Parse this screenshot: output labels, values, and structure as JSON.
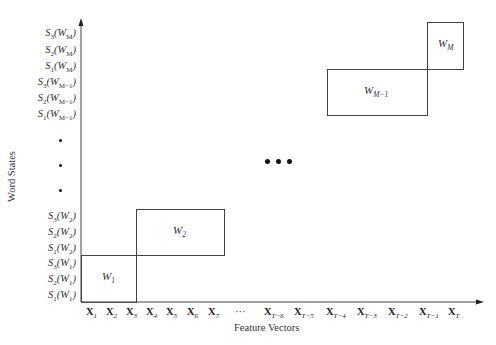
{
  "diagram": {
    "y_axis_title": "Word States",
    "x_axis_title": "Feature Vectors",
    "y_labels_top": [
      {
        "s": "S",
        "si": "3",
        "w": "W",
        "wi": "M",
        "text": "S3(WM)"
      },
      {
        "s": "S",
        "si": "2",
        "w": "W",
        "wi": "M",
        "text": "S2(WM)"
      },
      {
        "s": "S",
        "si": "1",
        "w": "W",
        "wi": "M",
        "text": "S1(WM)"
      },
      {
        "s": "S",
        "si": "3",
        "w": "W",
        "wi": "M−1",
        "text": "S3(WM−1)"
      },
      {
        "s": "S",
        "si": "2",
        "w": "W",
        "wi": "M−1",
        "text": "S2(WM−1)"
      },
      {
        "s": "S",
        "si": "1",
        "w": "W",
        "wi": "M−1",
        "text": "S1(WM−1)"
      }
    ],
    "y_labels_bottom": [
      {
        "s": "S",
        "si": "3",
        "w": "W",
        "wi": "2",
        "text": "S3(W2)"
      },
      {
        "s": "S",
        "si": "2",
        "w": "W",
        "wi": "2",
        "text": "S2(W2)"
      },
      {
        "s": "S",
        "si": "1",
        "w": "W",
        "wi": "2",
        "text": "S1(W2)"
      },
      {
        "s": "S",
        "si": "3",
        "w": "W",
        "wi": "1",
        "text": "S3(W1)"
      },
      {
        "s": "S",
        "si": "2",
        "w": "W",
        "wi": "1",
        "text": "S2(W1)"
      },
      {
        "s": "S",
        "si": "1",
        "w": "W",
        "wi": "1",
        "text": "S1(W1)"
      }
    ],
    "x_labels": [
      {
        "b": "X",
        "i": "1"
      },
      {
        "b": "X",
        "i": "2"
      },
      {
        "b": "X",
        "i": "3"
      },
      {
        "b": "X",
        "i": "4"
      },
      {
        "b": "X",
        "i": "5"
      },
      {
        "b": "X",
        "i": "6"
      },
      {
        "b": "X",
        "i": "7"
      },
      {
        "b": "···",
        "i": ""
      },
      {
        "b": "X",
        "i": "T−6"
      },
      {
        "b": "X",
        "i": "T−5"
      },
      {
        "b": "X",
        "i": "T−4"
      },
      {
        "b": "X",
        "i": "T−3"
      },
      {
        "b": "X",
        "i": "T−2"
      },
      {
        "b": "X",
        "i": "T−1"
      },
      {
        "b": "X",
        "i": "T"
      }
    ],
    "boxes": [
      {
        "name": "W",
        "sub": "1"
      },
      {
        "name": "W",
        "sub": "2"
      },
      {
        "name": "W",
        "sub": "M−1"
      },
      {
        "name": "W",
        "sub": "M"
      }
    ],
    "vertical_ellipsis": "⋮",
    "center_ellipsis": "•••"
  }
}
